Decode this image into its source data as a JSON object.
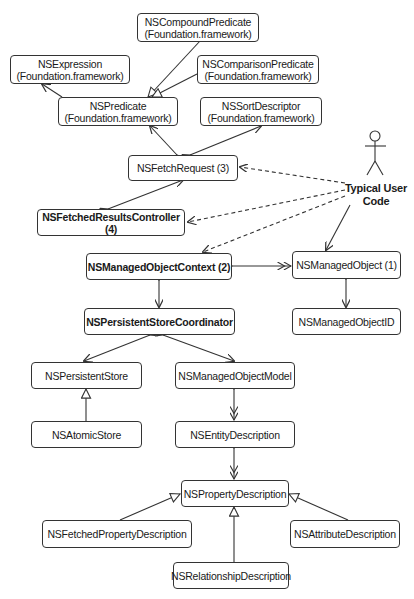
{
  "diagram": {
    "type": "UML class diagram",
    "actor": {
      "label_line1": "Typical User",
      "label_line2": "Code"
    },
    "nodes": {
      "compound_predicate": {
        "name": "NSCompoundPredicate",
        "framework": "(Foundation.framework)"
      },
      "expression": {
        "name": "NSExpression",
        "framework": "(Foundation.framework)"
      },
      "comparison_predicate": {
        "name": "NSComparisonPredicate",
        "framework": "(Foundation.framework)"
      },
      "predicate": {
        "name": "NSPredicate",
        "framework": "(Foundation.framework)"
      },
      "sort_descriptor": {
        "name": "NSSortDescriptor",
        "framework": "(Foundation.framework)"
      },
      "fetch_request": {
        "name": "NSFetchRequest (3)"
      },
      "fetched_results_controller": {
        "name": "NSFetchedResultsController (4)"
      },
      "managed_object_context": {
        "name": "NSManagedObjectContext (2)"
      },
      "managed_object": {
        "name": "NSManagedObject (1)"
      },
      "persistent_store_coordinator": {
        "name": "NSPersistentStoreCoordinator"
      },
      "managed_object_id": {
        "name": "NSManagedObjectID"
      },
      "persistent_store": {
        "name": "NSPersistentStore"
      },
      "managed_object_model": {
        "name": "NSManagedObjectModel"
      },
      "atomic_store": {
        "name": "NSAtomicStore"
      },
      "entity_description": {
        "name": "NSEntityDescription"
      },
      "property_description": {
        "name": "NSPropertyDescription"
      },
      "fetched_property_description": {
        "name": "NSFetchedPropertyDescription"
      },
      "attribute_description": {
        "name": "NSAttributeDescription"
      },
      "relationship_description": {
        "name": "NSRelationshipDescription"
      }
    },
    "edges": [
      {
        "from": "NSCompoundPredicate",
        "to": "NSPredicate",
        "kind": "generalization"
      },
      {
        "from": "NSComparisonPredicate",
        "to": "NSPredicate",
        "kind": "generalization"
      },
      {
        "from": "NSPredicate",
        "to": "NSExpression",
        "kind": "association"
      },
      {
        "from": "NSFetchRequest",
        "to": "NSPredicate",
        "kind": "aggregation"
      },
      {
        "from": "NSFetchRequest",
        "to": "NSSortDescriptor",
        "kind": "aggregation"
      },
      {
        "from": "NSFetchedResultsController",
        "to": "NSFetchRequest",
        "kind": "aggregation"
      },
      {
        "from": "Typical User Code",
        "to": "NSFetchRequest",
        "kind": "dependency"
      },
      {
        "from": "Typical User Code",
        "to": "NSFetchedResultsController",
        "kind": "dependency"
      },
      {
        "from": "Typical User Code",
        "to": "NSManagedObjectContext",
        "kind": "dependency"
      },
      {
        "from": "Typical User Code",
        "to": "NSManagedObject",
        "kind": "association"
      },
      {
        "from": "NSManagedObjectContext",
        "to": "NSManagedObject",
        "kind": "aggregation-many"
      },
      {
        "from": "NSManagedObjectContext",
        "to": "NSPersistentStoreCoordinator",
        "kind": "composition"
      },
      {
        "from": "NSManagedObject",
        "to": "NSManagedObjectID",
        "kind": "composition"
      },
      {
        "from": "NSPersistentStoreCoordinator",
        "to": "NSPersistentStore",
        "kind": "aggregation"
      },
      {
        "from": "NSPersistentStoreCoordinator",
        "to": "NSManagedObjectModel",
        "kind": "aggregation"
      },
      {
        "from": "NSAtomicStore",
        "to": "NSPersistentStore",
        "kind": "generalization"
      },
      {
        "from": "NSManagedObjectModel",
        "to": "NSEntityDescription",
        "kind": "aggregation-many"
      },
      {
        "from": "NSEntityDescription",
        "to": "NSPropertyDescription",
        "kind": "aggregation-many"
      },
      {
        "from": "NSFetchedPropertyDescription",
        "to": "NSPropertyDescription",
        "kind": "generalization"
      },
      {
        "from": "NSRelationshipDescription",
        "to": "NSPropertyDescription",
        "kind": "generalization"
      },
      {
        "from": "NSAttributeDescription",
        "to": "NSPropertyDescription",
        "kind": "generalization"
      }
    ],
    "colors": {
      "line": "#333333",
      "background": "#ffffff",
      "text": "#1a1a1a"
    }
  }
}
